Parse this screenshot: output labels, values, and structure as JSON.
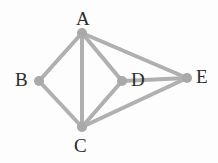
{
  "figure": {
    "kind": "undirected-graph-diagram",
    "width": 218,
    "height": 163,
    "background_color": "#fdfdfd",
    "edge_color": "#b0b0b0",
    "node_color": "#a9a9a9",
    "label_color": "#2b2b2b",
    "edge_width": 4,
    "node_radius": 5
  },
  "graph": {
    "vertices": [
      {
        "id": "A",
        "label": "A",
        "x": 82,
        "y": 33,
        "label_x": 76,
        "label_y": 9,
        "label_position": "above"
      },
      {
        "id": "B",
        "label": "B",
        "x": 39,
        "y": 81,
        "label_x": 15,
        "label_y": 70,
        "label_position": "left"
      },
      {
        "id": "C",
        "label": "C",
        "x": 82,
        "y": 127,
        "label_x": 74,
        "label_y": 136,
        "label_position": "below"
      },
      {
        "id": "D",
        "label": "D",
        "x": 122,
        "y": 81,
        "label_x": 131,
        "label_y": 70,
        "label_position": "right"
      },
      {
        "id": "E",
        "label": "E",
        "x": 187,
        "y": 78,
        "label_x": 196,
        "label_y": 67,
        "label_position": "right"
      }
    ],
    "edges": [
      {
        "from": "A",
        "to": "B"
      },
      {
        "from": "A",
        "to": "C"
      },
      {
        "from": "A",
        "to": "D"
      },
      {
        "from": "A",
        "to": "E"
      },
      {
        "from": "B",
        "to": "C"
      },
      {
        "from": "C",
        "to": "D"
      },
      {
        "from": "C",
        "to": "E"
      },
      {
        "from": "D",
        "to": "E"
      }
    ]
  }
}
